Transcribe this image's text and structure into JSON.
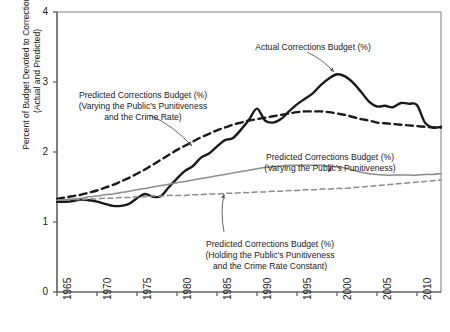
{
  "chart_data": {
    "type": "line",
    "title": "",
    "xlabel": "",
    "ylabel": "Percent of Budget Devoted to Corrections\n(Actual and Predicted)",
    "xlim": [
      1965,
      2013
    ],
    "ylim": [
      0,
      4
    ],
    "grid": false,
    "legend_position": "inline-annotations",
    "xticks": [
      "1965",
      "1970",
      "1975",
      "1980",
      "1985",
      "1990",
      "1995",
      "2000",
      "2005",
      "2010"
    ],
    "xtick_values": [
      1965,
      1970,
      1975,
      1980,
      1985,
      1990,
      1995,
      2000,
      2005,
      2010
    ],
    "yticks": [
      "0",
      "1",
      "2",
      "3",
      "4"
    ],
    "ytick_values": [
      0,
      1,
      2,
      3,
      4
    ],
    "x": [
      1965,
      1966,
      1967,
      1968,
      1969,
      1970,
      1971,
      1972,
      1973,
      1974,
      1975,
      1976,
      1977,
      1978,
      1979,
      1980,
      1981,
      1982,
      1983,
      1984,
      1985,
      1986,
      1987,
      1988,
      1989,
      1990,
      1991,
      1992,
      1993,
      1994,
      1995,
      1996,
      1997,
      1998,
      1999,
      2000,
      2001,
      2002,
      2003,
      2004,
      2005,
      2006,
      2007,
      2008,
      2009,
      2010,
      2011,
      2012,
      2013
    ],
    "series": [
      {
        "name": "Actual Corrections Budget (%)",
        "style": "solid",
        "color": "#1a1a1a",
        "width": 2.4,
        "values": [
          1.29,
          1.29,
          1.3,
          1.32,
          1.31,
          1.29,
          1.26,
          1.23,
          1.23,
          1.26,
          1.34,
          1.4,
          1.36,
          1.37,
          1.5,
          1.62,
          1.73,
          1.8,
          1.92,
          1.98,
          2.08,
          2.17,
          2.2,
          2.32,
          2.46,
          2.62,
          2.45,
          2.42,
          2.47,
          2.58,
          2.68,
          2.76,
          2.84,
          2.96,
          3.05,
          3.11,
          3.08,
          2.99,
          2.86,
          2.72,
          2.65,
          2.66,
          2.64,
          2.7,
          2.69,
          2.67,
          2.42,
          2.35,
          2.36
        ]
      },
      {
        "name": "Predicted Corrections Budget (%) (Varying the Public's Punitiveness and the Crime Rate)",
        "style": "dashed",
        "color": "#1a1a1a",
        "width": 2.4,
        "values": [
          1.33,
          1.35,
          1.37,
          1.39,
          1.42,
          1.45,
          1.49,
          1.53,
          1.58,
          1.63,
          1.69,
          1.75,
          1.82,
          1.89,
          1.96,
          2.03,
          2.09,
          2.15,
          2.21,
          2.26,
          2.31,
          2.35,
          2.39,
          2.42,
          2.45,
          2.47,
          2.49,
          2.51,
          2.53,
          2.55,
          2.57,
          2.58,
          2.58,
          2.58,
          2.57,
          2.55,
          2.53,
          2.5,
          2.47,
          2.45,
          2.42,
          2.41,
          2.4,
          2.39,
          2.38,
          2.37,
          2.36,
          2.35,
          2.35
        ]
      },
      {
        "name": "Predicted Corrections Budget (%) (Varying the Public's Punitiveness)",
        "style": "solid",
        "color": "#8c8c8c",
        "width": 1.5,
        "values": [
          1.31,
          1.32,
          1.33,
          1.34,
          1.36,
          1.37,
          1.39,
          1.4,
          1.42,
          1.44,
          1.46,
          1.48,
          1.5,
          1.52,
          1.54,
          1.56,
          1.58,
          1.6,
          1.62,
          1.64,
          1.66,
          1.68,
          1.7,
          1.72,
          1.74,
          1.76,
          1.78,
          1.79,
          1.8,
          1.81,
          1.81,
          1.81,
          1.81,
          1.81,
          1.8,
          1.79,
          1.77,
          1.74,
          1.71,
          1.69,
          1.68,
          1.67,
          1.67,
          1.67,
          1.67,
          1.67,
          1.68,
          1.68,
          1.69
        ]
      },
      {
        "name": "Predicted Corrections Budget (%) (Holding the Public's Punitiveness and the Crime Rate Constant)",
        "style": "dashed",
        "color": "#8c8c8c",
        "width": 1.5,
        "values": [
          1.31,
          1.31,
          1.32,
          1.32,
          1.33,
          1.33,
          1.34,
          1.34,
          1.35,
          1.35,
          1.36,
          1.36,
          1.37,
          1.37,
          1.38,
          1.38,
          1.38,
          1.39,
          1.39,
          1.4,
          1.4,
          1.41,
          1.41,
          1.42,
          1.42,
          1.43,
          1.43,
          1.44,
          1.44,
          1.45,
          1.45,
          1.46,
          1.46,
          1.47,
          1.47,
          1.48,
          1.48,
          1.49,
          1.5,
          1.51,
          1.52,
          1.53,
          1.54,
          1.55,
          1.56,
          1.57,
          1.58,
          1.59,
          1.6
        ]
      }
    ],
    "annotations": [
      {
        "id": "actual-corrections-budget",
        "text": "Actual Corrections Budget (%)",
        "text_x": 313,
        "text_y": 42,
        "arrow": {
          "x1": 307,
          "y1": 52,
          "x2": 334,
          "y2": 72
        }
      },
      {
        "id": "predicted-punitiveness-and-crime-rate",
        "text": "Predicted Corrections Budget (%)\n(Varying the Public's Punitiveness\nand the Crime Rate)",
        "text_x": 143,
        "text_y": 90,
        "arrow": {
          "x1": 150,
          "y1": 115,
          "x2": 192,
          "y2": 146
        }
      },
      {
        "id": "predicted-punitiveness",
        "text": "Predicted Corrections Budget (%)\n(Varying the Public's Punitiveness)",
        "text_x": 330,
        "text_y": 152,
        "arrow": {
          "x1": 333,
          "y1": 164,
          "x2": 328,
          "y2": 172
        }
      },
      {
        "id": "predicted-constant",
        "text": "Predicted Corrections Budget (%)\n(Holding the Public's Punitiveness\nand the Crime Rate Constant)",
        "text_x": 270,
        "text_y": 239,
        "arrow": {
          "x1": 224,
          "y1": 232,
          "x2": 224,
          "y2": 194
        }
      }
    ]
  },
  "axes": {
    "ylabel_line1": "Percent of Budget Devoted to Corrections",
    "ylabel_line2": "(Actual and Predicted)"
  },
  "colors": {
    "actual_line": "#1a1a1a",
    "predicted_dark": "#1a1a1a",
    "predicted_gray": "#8c8c8c",
    "axis": "#666666",
    "text": "#1a1a1a",
    "background": "#ffffff"
  }
}
